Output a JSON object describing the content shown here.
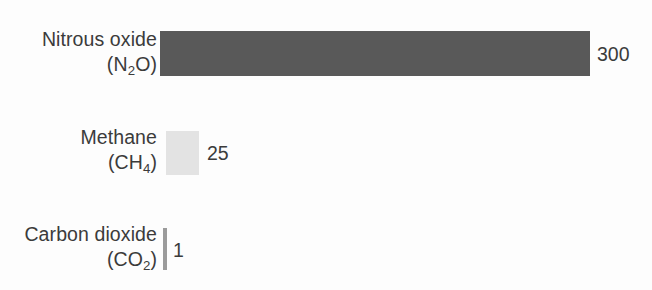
{
  "chart_data": {
    "type": "bar",
    "orientation": "horizontal",
    "title": "",
    "subtitle": "",
    "xlabel": "",
    "ylabel": "",
    "grid": false,
    "legend": "none",
    "axis_visible": false,
    "xlim": [
      0,
      300
    ],
    "categories": [
      "Nitrous oxide (N2O)",
      "Methane (CH4)",
      "Carbon dioxide (CO2)"
    ],
    "values": [
      300,
      25,
      1
    ],
    "value_labels": [
      "300",
      "25",
      "1"
    ],
    "bar_colors": [
      "#595959",
      "#e3e3e3",
      "#9b9b9b"
    ],
    "background_color": "#fdfdfd",
    "text_color": "#3b3b3b",
    "bars": [
      {
        "name_line1": "Nitrous oxide",
        "formula_prefix": "(N",
        "formula_sub": "2",
        "formula_suffix": "O)",
        "value": 300,
        "value_label": "300",
        "color": "#595959"
      },
      {
        "name_line1": "Methane",
        "formula_prefix": "(CH",
        "formula_sub": "4",
        "formula_suffix": ")",
        "value": 25,
        "value_label": "25",
        "color": "#e3e3e3"
      },
      {
        "name_line1": "Carbon dioxide",
        "formula_prefix": "(CO",
        "formula_sub": "2",
        "formula_suffix": ")",
        "value": 1,
        "value_label": "1",
        "color": "#9b9b9b"
      }
    ]
  }
}
